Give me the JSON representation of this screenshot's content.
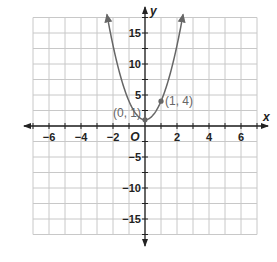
{
  "chart_data": {
    "type": "line",
    "title": "",
    "xlabel": "x",
    "ylabel": "y",
    "xlim": [
      -7,
      7
    ],
    "ylim": [
      -17.5,
      17.5
    ],
    "grid": true,
    "x_grid_step": 1,
    "y_grid_step": 2.5,
    "x_tick_labels": [
      "-6",
      "-4",
      "-2",
      "2",
      "4",
      "6"
    ],
    "x_tick_values": [
      -6,
      -4,
      -2,
      2,
      4,
      6
    ],
    "y_tick_labels": [
      "15",
      "10",
      "5",
      "-5",
      "-10",
      "-15"
    ],
    "y_tick_values": [
      15,
      10,
      5,
      -5,
      -10,
      -15
    ],
    "origin_label": "O",
    "series": [
      {
        "name": "y = 3x^2 + 1",
        "kind": "parabola",
        "a": 3,
        "b": 0,
        "c": 1,
        "x_range": [
          -2.38,
          2.38
        ],
        "arrows_at_ends": true,
        "color": "#666666"
      }
    ],
    "points": [
      {
        "x": 0,
        "y": 1,
        "label": "(0, 1)",
        "label_pos": "left"
      },
      {
        "x": 1,
        "y": 4,
        "label": "(1, 4)",
        "label_pos": "right"
      }
    ],
    "colors": {
      "grid": "#c8c8c8",
      "axes": "#222222",
      "curve": "#666666",
      "point": "#666666"
    }
  }
}
